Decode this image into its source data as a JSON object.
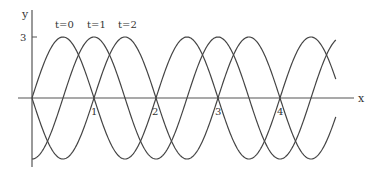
{
  "chart_data": {
    "type": "line",
    "title": "",
    "xlabel": "x",
    "ylabel": "y",
    "xticks": [
      "1",
      "2",
      "3",
      "4"
    ],
    "yticks": [
      "3"
    ],
    "xlim": [
      0,
      4.9
    ],
    "ylim": [
      -3,
      3
    ],
    "grid": false,
    "series": [
      {
        "name": "t=0",
        "formula": "y = 3 sin(pi x)",
        "shift": 0
      },
      {
        "name": "t=1",
        "formula": "y = 3 sin(pi (x - 0.5))",
        "shift": 0.5
      },
      {
        "name": "t=2",
        "formula": "y = 3 sin(pi (x - 1))",
        "shift": 1
      }
    ],
    "amplitude": 3,
    "wavelength": 2
  },
  "labels": {
    "y_axis": "y",
    "x_axis": "x",
    "y_tick_3": "3",
    "x_tick_1": "1",
    "x_tick_2": "2",
    "x_tick_3": "3",
    "x_tick_4": "4",
    "t0": "t=0",
    "t1": "t=1",
    "t2": "t=2"
  }
}
